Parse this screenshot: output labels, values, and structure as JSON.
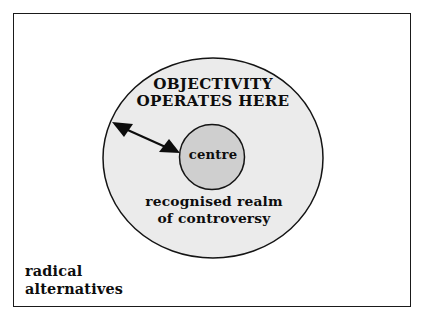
{
  "figure": {
    "type": "concentric-circles-diagram",
    "frame": {
      "border_color": "#1a1a1a",
      "background_color": "#ffffff"
    },
    "outer_region": {
      "name": "recognised realm of controversy",
      "fill_color": "#ebebeb",
      "stroke_color": "#141414",
      "heading": "OBJECTIVITY\nOPERATES HERE",
      "caption": "recognised realm\nof controversy"
    },
    "inner_region": {
      "name": "centre",
      "label": "centre",
      "fill_color": "#cfcfcf",
      "stroke_color": "#141414"
    },
    "outside_region": {
      "label": "radical\nalternatives",
      "fill_color": "#ffffff"
    },
    "arrow": {
      "name": "double-headed-arrow",
      "color": "#0d0d0d",
      "from": "outer edge of recognised realm",
      "to": "centre",
      "double_headed": true
    }
  }
}
